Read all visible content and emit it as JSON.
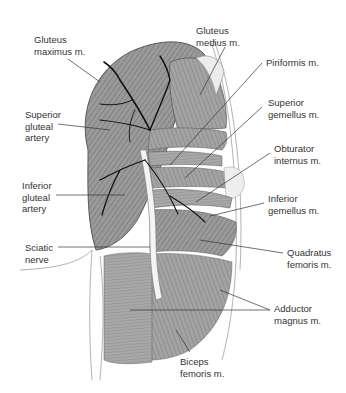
{
  "figure": {
    "colors": {
      "muscle_fill": "#8f8f8f",
      "muscle_light": "#b5b5b5",
      "artery": "#111111",
      "nerve": "#f2f2f2",
      "leader_line": "#333333",
      "label_text": "#333333",
      "outline": "#9a9a9a"
    },
    "labels": [
      {
        "id": "gluteus-maximus",
        "text": "Gluteus\nmaximus m.",
        "x": 34,
        "y": 34
      },
      {
        "id": "gluteus-medius",
        "text": "Gluteus\nmedius m.",
        "x": 196,
        "y": 25
      },
      {
        "id": "piriformis",
        "text": "Piriformis m.",
        "x": 266,
        "y": 57
      },
      {
        "id": "superior-gemellus",
        "text": "Superior\ngemellus m.",
        "x": 268,
        "y": 97
      },
      {
        "id": "obturator-internus",
        "text": "Obturator\ninternus m.",
        "x": 274,
        "y": 143
      },
      {
        "id": "inferior-gemellus",
        "text": "Inferior\ngemellus m.",
        "x": 268,
        "y": 193
      },
      {
        "id": "quadratus-femoris",
        "text": "Quadratus\nfemoris m.",
        "x": 287,
        "y": 247
      },
      {
        "id": "adductor-magnus",
        "text": "Adductor\nmagnus m.",
        "x": 274,
        "y": 303
      },
      {
        "id": "biceps-femoris",
        "text": "Biceps\nfemoris m.",
        "x": 180,
        "y": 356
      },
      {
        "id": "superior-gluteal-artery",
        "text": "Superior\ngluteal\nartery",
        "x": 25,
        "y": 109
      },
      {
        "id": "inferior-gluteal-artery",
        "text": "Inferior\ngluteal\nartery",
        "x": 22,
        "y": 180
      },
      {
        "id": "sciatic-nerve",
        "text": "Sciatic\nnerve",
        "x": 25,
        "y": 242
      }
    ]
  }
}
